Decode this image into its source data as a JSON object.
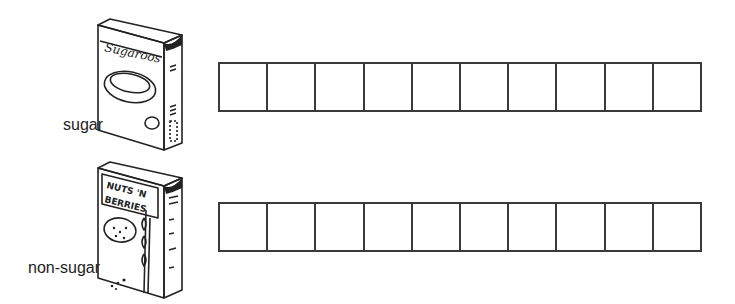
{
  "rows": [
    {
      "label": "sugar",
      "box_title_line1": "Sugaroos",
      "box_title_line2": "",
      "cells": 10
    },
    {
      "label": "non-sugar",
      "box_title_line1": "NUTS 'N",
      "box_title_line2": "BERRIES",
      "cells": 10
    }
  ]
}
